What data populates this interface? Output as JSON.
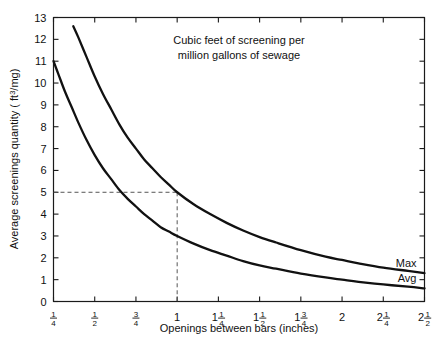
{
  "chart_data": {
    "type": "line",
    "title": "",
    "annotation": [
      "Cubic feet of screening per",
      "million gallons of sewage"
    ],
    "xlabel": "Openings between bars (inches)",
    "ylabel": "Average screenings quantity ( ft3/mg)",
    "ylabel_prefix": "Average screenings quantity ( ft",
    "ylabel_sup": "3",
    "ylabel_suffix": "/mg)",
    "xlim": [
      0.25,
      2.5
    ],
    "ylim": [
      0,
      13
    ],
    "grid": false,
    "legend_position": "inline-right",
    "x_tick_values": [
      0.25,
      0.5,
      0.75,
      1.0,
      1.25,
      1.5,
      1.75,
      2.0,
      2.25,
      2.5
    ],
    "x_tick_labels": [
      {
        "whole": "",
        "num": "1",
        "den": "4"
      },
      {
        "whole": "",
        "num": "1",
        "den": "2"
      },
      {
        "whole": "",
        "num": "3",
        "den": "4"
      },
      {
        "whole": "1",
        "num": "",
        "den": ""
      },
      {
        "whole": "1",
        "num": "1",
        "den": "4"
      },
      {
        "whole": "1",
        "num": "1",
        "den": "2"
      },
      {
        "whole": "1",
        "num": "3",
        "den": "4"
      },
      {
        "whole": "2",
        "num": "",
        "den": ""
      },
      {
        "whole": "2",
        "num": "1",
        "den": "4"
      },
      {
        "whole": "2",
        "num": "1",
        "den": "2"
      }
    ],
    "y_tick_values": [
      0,
      1,
      2,
      3,
      4,
      5,
      6,
      7,
      8,
      9,
      10,
      11,
      12,
      13
    ],
    "y_tick_labels": [
      "0",
      "1",
      "2",
      "3",
      "4",
      "5",
      "6",
      "7",
      "8",
      "9",
      "10",
      "11",
      "12",
      "13"
    ],
    "series": [
      {
        "name": "Max",
        "label": "Max",
        "x": [
          0.37,
          0.4,
          0.45,
          0.5,
          0.55,
          0.6,
          0.65,
          0.7,
          0.75,
          0.8,
          0.85,
          0.9,
          0.95,
          1.0,
          1.1,
          1.2,
          1.3,
          1.4,
          1.5,
          1.6,
          1.75,
          1.9,
          2.0,
          2.1,
          2.25,
          2.4,
          2.5
        ],
        "values": [
          12.6,
          12.1,
          11.2,
          10.3,
          9.5,
          8.8,
          8.1,
          7.5,
          7.0,
          6.5,
          6.1,
          5.7,
          5.35,
          5.0,
          4.45,
          4.0,
          3.6,
          3.25,
          2.95,
          2.7,
          2.35,
          2.05,
          1.9,
          1.75,
          1.55,
          1.4,
          1.3
        ]
      },
      {
        "name": "Avg",
        "label": "Avg",
        "x": [
          0.25,
          0.28,
          0.32,
          0.36,
          0.4,
          0.45,
          0.5,
          0.55,
          0.6,
          0.65,
          0.7,
          0.75,
          0.8,
          0.85,
          0.9,
          0.95,
          1.0,
          1.1,
          1.2,
          1.3,
          1.4,
          1.5,
          1.6,
          1.75,
          1.9,
          2.0,
          2.1,
          2.25,
          2.4,
          2.5
        ],
        "values": [
          11.0,
          10.4,
          9.6,
          8.9,
          8.2,
          7.4,
          6.7,
          6.1,
          5.6,
          5.1,
          4.7,
          4.35,
          4.0,
          3.7,
          3.4,
          3.2,
          3.0,
          2.65,
          2.35,
          2.1,
          1.85,
          1.65,
          1.5,
          1.28,
          1.1,
          1.0,
          0.9,
          0.78,
          0.68,
          0.6
        ]
      }
    ],
    "guide_lines": [
      {
        "name": "reading-guide",
        "from_y": 5.0,
        "to_x": 1.0
      }
    ]
  }
}
